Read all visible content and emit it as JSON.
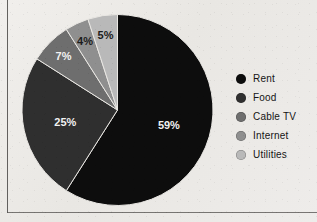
{
  "figure": {
    "background_color": "#eceae6",
    "border_color": "#4a4845"
  },
  "chart_data": {
    "type": "pie",
    "title": "",
    "categories": [
      "Rent",
      "Food",
      "Cable TV",
      "Internet",
      "Utilities"
    ],
    "values": [
      59,
      25,
      7,
      4,
      5
    ],
    "value_labels": [
      "59%",
      "25%",
      "7%",
      "4%",
      "5%"
    ],
    "units": "percent",
    "start_angle_deg": 0,
    "direction": "clockwise",
    "colors": [
      "#0d0d0d",
      "#2f2f2f",
      "#6e6e6e",
      "#8f8f8f",
      "#b9b9b9"
    ],
    "label_colors": [
      "#f2f2f2",
      "#f2f2f2",
      "#f2f2f2",
      "#1b1b1b",
      "#1b1b1b"
    ],
    "legend_position": "right",
    "grid": false,
    "xlabel": "",
    "ylabel": ""
  },
  "legend": {
    "items": [
      {
        "label": "Rent",
        "color": "#0d0d0d",
        "value_label": "59%"
      },
      {
        "label": "Food",
        "color": "#2f2f2f",
        "value_label": "25%"
      },
      {
        "label": "Cable TV",
        "color": "#6e6e6e",
        "value_label": "7%"
      },
      {
        "label": "Internet",
        "color": "#8f8f8f",
        "value_label": "4%"
      },
      {
        "label": "Utilities",
        "color": "#b9b9b9",
        "value_label": "5%"
      }
    ]
  }
}
